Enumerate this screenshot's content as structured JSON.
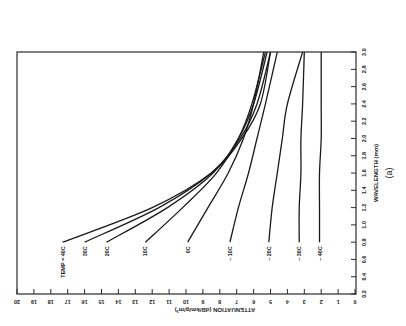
{
  "chart_data": {
    "type": "line",
    "orientation": "rotated 90° counter-clockwise (x-axis vertical on right, y-axis horizontal along bottom)",
    "title": "",
    "subtitle": "(a)",
    "xlabel": "WAVELENGTH (mm)",
    "ylabel": "ATTENUATION (dB/km/g/m³)",
    "xlim": [
      0.2,
      3.0
    ],
    "ylim": [
      0,
      20
    ],
    "xticks": [
      "0.2",
      "0.4",
      "0.6",
      "0.8",
      "1.0",
      "1.2",
      "1.4",
      "1.6",
      "1.8",
      "2.0",
      "2.2",
      "2.4",
      "2.6",
      "2.8",
      "3.0"
    ],
    "yticks": [
      "0",
      "1",
      "2",
      "3",
      "4",
      "5",
      "6",
      "7",
      "8",
      "9",
      "10",
      "11",
      "12",
      "13",
      "14",
      "15",
      "16",
      "17",
      "18",
      "19",
      "20"
    ],
    "grid": false,
    "legend": "inline labels at curve start (λ≈0.8 mm)",
    "x": [
      0.8,
      1.2,
      1.6,
      2.0,
      2.4,
      3.0
    ],
    "series": [
      {
        "name": "TEMP = 40C",
        "label": "TEMP = 40C",
        "values": [
          17.3,
          12.0,
          8.5,
          6.7,
          5.6,
          5.0
        ]
      },
      {
        "name": "30C",
        "label": "30C",
        "values": [
          16.0,
          11.6,
          8.5,
          6.8,
          5.8,
          5.0
        ]
      },
      {
        "name": "20C",
        "label": "20C",
        "values": [
          14.7,
          11.1,
          8.4,
          6.9,
          6.0,
          5.2
        ]
      },
      {
        "name": "10C",
        "label": "10C",
        "values": [
          12.4,
          10.2,
          8.2,
          6.9,
          6.1,
          5.3
        ]
      },
      {
        "name": "0C",
        "label": "0C",
        "values": [
          9.9,
          8.7,
          7.5,
          6.6,
          6.0,
          5.4
        ]
      },
      {
        "name": "-10C",
        "label": "– 10C",
        "values": [
          7.4,
          6.9,
          6.3,
          5.8,
          5.3,
          4.6
        ]
      },
      {
        "name": "-20C",
        "label": "– 20C",
        "values": [
          5.1,
          4.9,
          4.6,
          4.3,
          4.0,
          3.1
        ]
      },
      {
        "name": "-30C",
        "label": "– 30C",
        "values": [
          3.3,
          3.3,
          3.2,
          3.2,
          3.1,
          3.0
        ]
      },
      {
        "name": "-40C",
        "label": "– 40C",
        "values": [
          2.1,
          2.1,
          2.1,
          2.0,
          2.0,
          2.0
        ]
      }
    ]
  }
}
